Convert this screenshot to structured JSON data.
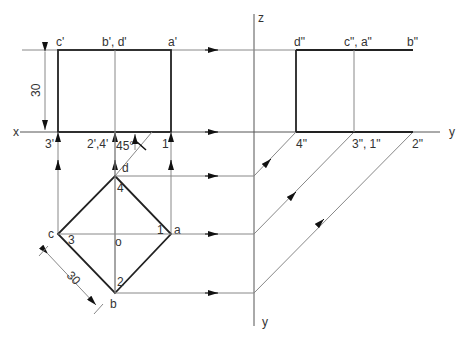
{
  "figure": {
    "axes": {
      "x_label": "x",
      "y_label_right": "y",
      "z_label": "z",
      "y_label_bottom": "y"
    },
    "front_view": {
      "labels_top": [
        "c'",
        "b', d'",
        "a'"
      ],
      "labels_bottom": [
        "3'",
        "2',4'",
        "1'"
      ],
      "height_dim": "30",
      "angle_label": "45°"
    },
    "side_view": {
      "labels_top": [
        "d\"",
        "c\", a\"",
        "b\""
      ],
      "labels_bottom": [
        "4\"",
        "3\", 1\"",
        "2\""
      ]
    },
    "top_view": {
      "vertices": [
        "a",
        "b",
        "c",
        "d"
      ],
      "center": "o",
      "inner_points": [
        "1",
        "2",
        "3",
        "4"
      ],
      "side_dim": "30"
    },
    "colors": {
      "object_line": "#222222",
      "projection_line": "#888888",
      "text": "#333333"
    }
  }
}
